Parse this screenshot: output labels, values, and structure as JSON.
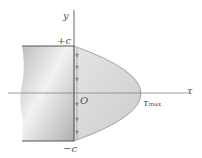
{
  "diagram": {
    "labels": {
      "y_axis": "y",
      "tau_axis": "τ",
      "top": "+c",
      "bottom": "−c",
      "origin": "O",
      "tau_max_main": "τ",
      "tau_max_sub": "max"
    },
    "colors": {
      "axis": "#7a7a7a",
      "outline": "#555555",
      "block_fill": "#cfcfcf",
      "parabola_fill": "#d9d9d9",
      "arrow": "#8a8a8a"
    }
  }
}
